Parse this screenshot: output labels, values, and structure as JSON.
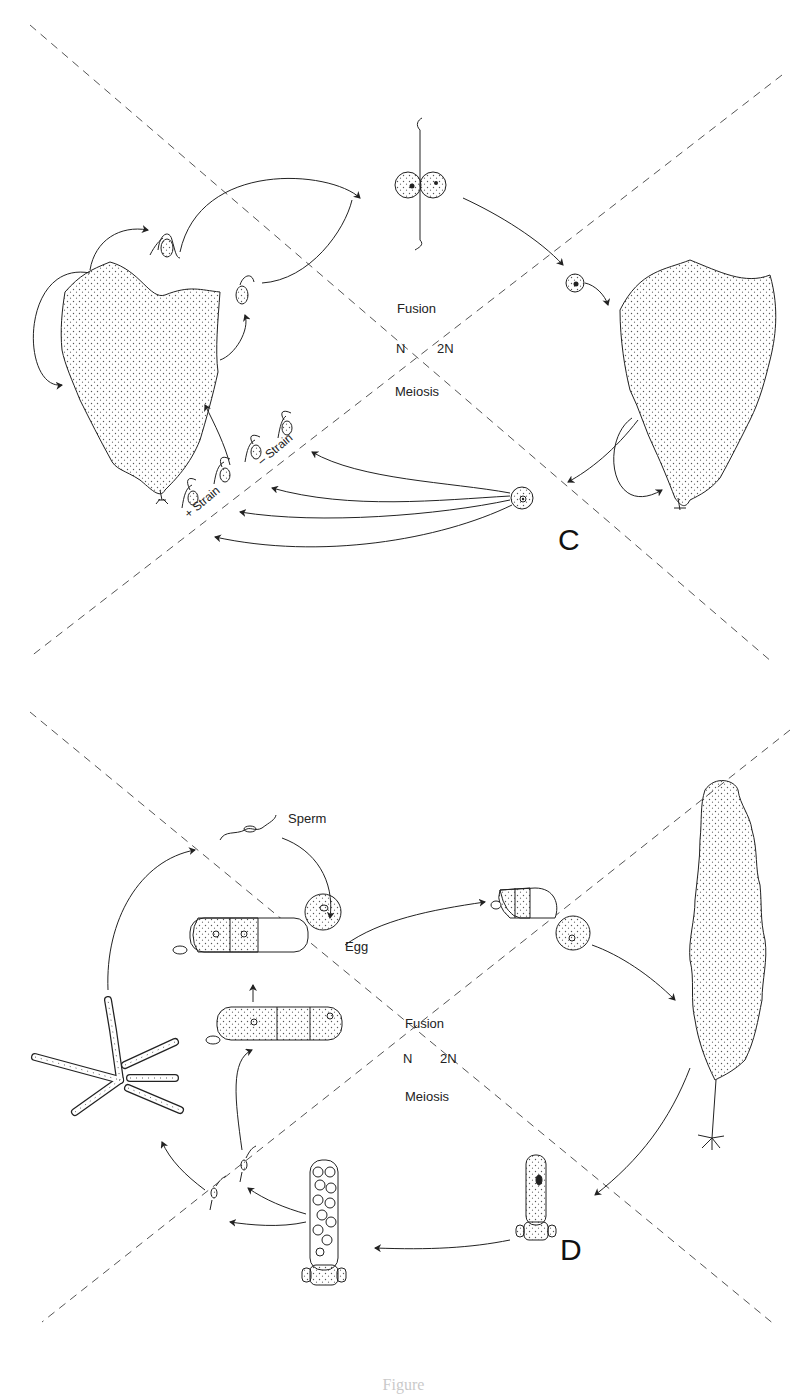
{
  "panels": [
    {
      "id": "C",
      "letter": "C",
      "phase_labels": {
        "top": "Fusion",
        "left": "N",
        "right": "2N",
        "bottom": "Meiosis"
      },
      "strain_labels": {
        "plus": "+ Strain",
        "minus": "– Strain"
      }
    },
    {
      "id": "D",
      "letter": "D",
      "phase_labels": {
        "top": "Fusion",
        "left": "N",
        "right": "2N",
        "bottom": "Meiosis"
      },
      "gamete_labels": {
        "sperm": "Sperm",
        "egg": "Egg"
      }
    }
  ],
  "caption": "Figure",
  "colors": {
    "line": "#333333",
    "dash": "#555555",
    "stipple": "#555555",
    "background": "#ffffff"
  }
}
